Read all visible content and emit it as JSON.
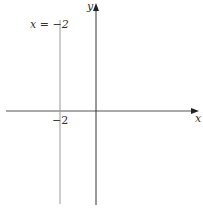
{
  "diagram": {
    "type": "coordinate-plane",
    "axes": {
      "x_label": "x",
      "y_label": "y"
    },
    "tick_labels": [
      {
        "axis": "x",
        "value": -2,
        "text": "−2"
      }
    ],
    "lines": [
      {
        "type": "vertical",
        "equation": "x = −2",
        "label": "x = −2",
        "x_value": -2
      }
    ],
    "colors": {
      "axis": "#222222",
      "line": "#8a8a8a",
      "background": "#ffffff"
    }
  }
}
